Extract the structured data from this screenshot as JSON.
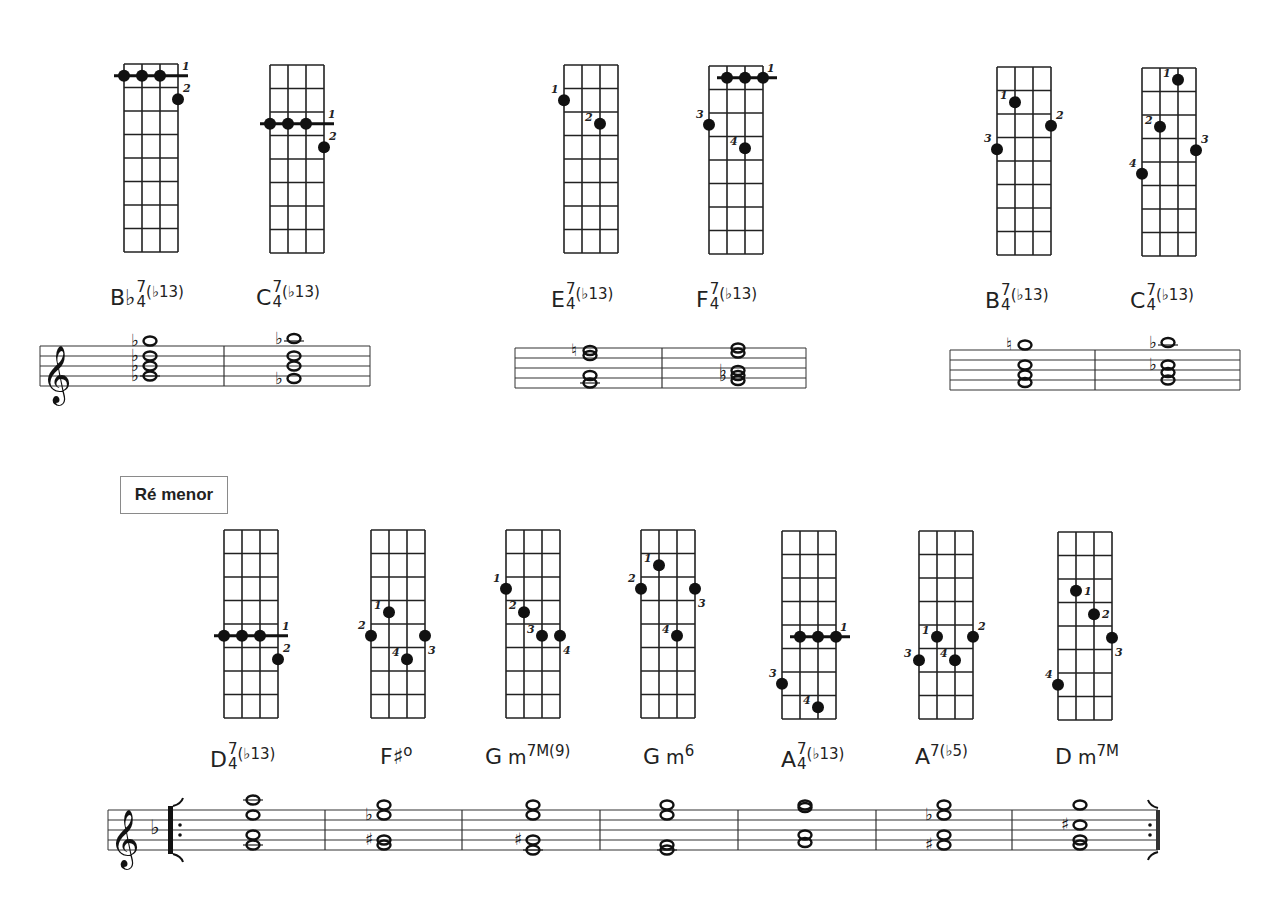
{
  "section": {
    "title": "Ré menor"
  },
  "chord_groups": [
    {
      "name": "group-1",
      "chords": [
        {
          "id": "bb4-7-b13",
          "root": "B♭",
          "sub": "4",
          "sup": "7",
          "ext": "(♭13)",
          "diagram": {
            "left": 124,
            "top": 64,
            "barre": {
              "fret": 0.5,
              "from": 0,
              "to": 2,
              "finger": "1"
            },
            "dots": [
              {
                "string": 3,
                "fret": 1.5,
                "finger": "2",
                "fpos": "ur"
              }
            ]
          }
        },
        {
          "id": "c4-7-b13",
          "root": "C",
          "sub": "4",
          "sup": "7",
          "ext": "(♭13)",
          "diagram": {
            "left": 270,
            "top": 65,
            "barre": {
              "fret": 2.5,
              "from": 0,
              "to": 2,
              "finger": "1"
            },
            "dots": [
              {
                "string": 3,
                "fret": 3.5,
                "finger": "2",
                "fpos": "ur"
              }
            ]
          }
        }
      ]
    },
    {
      "name": "group-2",
      "chords": [
        {
          "id": "e4-7-b13",
          "root": "E",
          "sub": "4",
          "sup": "7",
          "ext": "(♭13)",
          "diagram": {
            "left": 564,
            "top": 65,
            "barre": null,
            "dots": [
              {
                "string": 0,
                "fret": 1.5,
                "finger": "1",
                "fpos": "ul"
              },
              {
                "string": 2,
                "fret": 2.5,
                "finger": "2",
                "fpos": "l"
              }
            ]
          }
        },
        {
          "id": "f4-7-b13",
          "root": "F",
          "sub": "4",
          "sup": "7",
          "ext": "(♭13)",
          "diagram": {
            "left": 709,
            "top": 66,
            "barre": {
              "fret": 0.5,
              "from": 1,
              "to": 3,
              "finger": "1"
            },
            "dots": [
              {
                "string": 0,
                "fret": 2.5,
                "finger": "3",
                "fpos": "ul"
              },
              {
                "string": 2,
                "fret": 3.5,
                "finger": "4",
                "fpos": "l"
              }
            ]
          }
        }
      ]
    },
    {
      "name": "group-3",
      "chords": [
        {
          "id": "b4-7-b13",
          "root": "B",
          "sub": "4",
          "sup": "7",
          "ext": "(♭13)",
          "diagram": {
            "left": 997,
            "top": 67,
            "barre": null,
            "dots": [
              {
                "string": 1,
                "fret": 1.5,
                "finger": "1",
                "fpos": "l"
              },
              {
                "string": 3,
                "fret": 2.5,
                "finger": "2",
                "fpos": "ur"
              },
              {
                "string": 0,
                "fret": 3.5,
                "finger": "3",
                "fpos": "ul"
              }
            ]
          }
        },
        {
          "id": "c4-7-b13-alt",
          "root": "C",
          "sub": "4",
          "sup": "7",
          "ext": "(♭13)",
          "diagram": {
            "left": 1142,
            "top": 68,
            "barre": null,
            "dots": [
              {
                "string": 2,
                "fret": 0.5,
                "finger": "1",
                "fpos": "l"
              },
              {
                "string": 1,
                "fret": 2.5,
                "finger": "2",
                "fpos": "l"
              },
              {
                "string": 3,
                "fret": 3.5,
                "finger": "3",
                "fpos": "ur"
              },
              {
                "string": 0,
                "fret": 4.5,
                "finger": "4",
                "fpos": "ul"
              }
            ]
          }
        }
      ]
    },
    {
      "name": "re-menor",
      "chords": [
        {
          "id": "d4-7-b13",
          "root": "D",
          "sub": "4",
          "sup": "7",
          "ext": "(♭13)",
          "diagram": {
            "left": 224,
            "top": 530,
            "barre": {
              "fret": 4.5,
              "from": 0,
              "to": 2,
              "finger": "1"
            },
            "dots": [
              {
                "string": 3,
                "fret": 5.5,
                "finger": "2",
                "fpos": "ur"
              }
            ]
          }
        },
        {
          "id": "fsharp-dim",
          "root": "F♯",
          "sup": "o",
          "diagram": {
            "left": 371,
            "top": 530,
            "barre": null,
            "dots": [
              {
                "string": 1,
                "fret": 3.5,
                "finger": "1",
                "fpos": "l"
              },
              {
                "string": 0,
                "fret": 4.5,
                "finger": "2",
                "fpos": "ul"
              },
              {
                "string": 3,
                "fret": 4.5,
                "finger": "3",
                "fpos": "dr"
              },
              {
                "string": 2,
                "fret": 5.5,
                "finger": "4",
                "fpos": "l"
              }
            ]
          }
        },
        {
          "id": "gm7M9",
          "root": "G",
          "quality": "m",
          "sup": "7M(9)",
          "diagram": {
            "left": 506,
            "top": 530,
            "barre": null,
            "dots": [
              {
                "string": 0,
                "fret": 2.5,
                "finger": "1",
                "fpos": "ul"
              },
              {
                "string": 1,
                "fret": 3.5,
                "finger": "2",
                "fpos": "l"
              },
              {
                "string": 2,
                "fret": 4.5,
                "finger": "3",
                "fpos": "l"
              },
              {
                "string": 3,
                "fret": 4.5,
                "finger": "4",
                "fpos": "dr"
              }
            ]
          }
        },
        {
          "id": "gm6",
          "root": "G",
          "quality": "m",
          "sup": "6",
          "diagram": {
            "left": 641,
            "top": 530,
            "barre": null,
            "dots": [
              {
                "string": 1,
                "fret": 1.5,
                "finger": "1",
                "fpos": "l"
              },
              {
                "string": 0,
                "fret": 2.5,
                "finger": "2",
                "fpos": "ul"
              },
              {
                "string": 3,
                "fret": 2.5,
                "finger": "3",
                "fpos": "dr"
              },
              {
                "string": 2,
                "fret": 4.5,
                "finger": "4",
                "fpos": "l"
              }
            ]
          }
        },
        {
          "id": "a4-7-b13",
          "root": "A",
          "sub": "4",
          "sup": "7",
          "ext": "(♭13)",
          "diagram": {
            "left": 782,
            "top": 531,
            "barre": {
              "fret": 4.5,
              "from": 1,
              "to": 3,
              "finger": "1"
            },
            "dots": [
              {
                "string": 0,
                "fret": 6.5,
                "finger": "3",
                "fpos": "ul"
              },
              {
                "string": 2,
                "fret": 7.5,
                "finger": "4",
                "fpos": "l"
              }
            ]
          }
        },
        {
          "id": "a7-b5",
          "root": "A",
          "sup": "7(♭5)",
          "diagram": {
            "left": 919,
            "top": 531,
            "barre": null,
            "dots": [
              {
                "string": 1,
                "fret": 4.5,
                "finger": "1",
                "fpos": "l"
              },
              {
                "string": 3,
                "fret": 4.5,
                "finger": "2",
                "fpos": "ur"
              },
              {
                "string": 0,
                "fret": 5.5,
                "finger": "3",
                "fpos": "l"
              },
              {
                "string": 2,
                "fret": 5.5,
                "finger": "4",
                "fpos": "l"
              }
            ]
          }
        },
        {
          "id": "dm7M",
          "root": "D",
          "quality": "m",
          "sup": "7M",
          "diagram": {
            "left": 1058,
            "top": 532,
            "barre": null,
            "dots": [
              {
                "string": 1,
                "fret": 2.5,
                "finger": "1",
                "fpos": "r"
              },
              {
                "string": 2,
                "fret": 3.5,
                "finger": "2",
                "fpos": "r"
              },
              {
                "string": 3,
                "fret": 4.5,
                "finger": "3",
                "fpos": "dr"
              },
              {
                "string": 0,
                "fret": 6.5,
                "finger": "4",
                "fpos": "ul"
              }
            ]
          }
        }
      ]
    }
  ],
  "labels": [
    {
      "chord": "bb4-7-b13",
      "x": 110,
      "y": 284
    },
    {
      "chord": "c4-7-b13",
      "x": 256,
      "y": 284
    },
    {
      "chord": "e4-7-b13",
      "x": 551,
      "y": 286
    },
    {
      "chord": "f4-7-b13",
      "x": 696,
      "y": 286
    },
    {
      "chord": "b4-7-b13",
      "x": 985,
      "y": 287
    },
    {
      "chord": "c4-7-b13-alt",
      "x": 1130,
      "y": 287
    },
    {
      "chord": "d4-7-b13",
      "x": 210,
      "y": 746
    },
    {
      "chord": "fsharp-dim",
      "x": 380,
      "y": 746
    },
    {
      "chord": "gm7M9",
      "x": 485,
      "y": 746
    },
    {
      "chord": "gm6",
      "x": 643,
      "y": 746
    },
    {
      "chord": "a4-7-b13",
      "x": 781,
      "y": 746
    },
    {
      "chord": "a7-b5",
      "x": 915,
      "y": 746
    },
    {
      "chord": "dm7M",
      "x": 1055,
      "y": 746
    }
  ],
  "staves": [
    {
      "name": "staff-1",
      "x1": 40,
      "x2": 370,
      "top": 346,
      "clef": true,
      "key_flats": 0,
      "repeat": false,
      "barlines": [
        224
      ],
      "measures": [
        {
          "x": 150,
          "notes": [
            {
              "pos": -1,
              "acc": "♭"
            },
            {
              "pos": 2,
              "acc": "♭"
            },
            {
              "pos": 4,
              "acc": "♭"
            },
            {
              "pos": 6,
              "acc": "♭",
              "ledger": true
            }
          ]
        },
        {
          "x": 294,
          "notes": [
            {
              "pos": -1.5,
              "acc": "♭"
            },
            {
              "pos": 2
            },
            {
              "pos": 4
            },
            {
              "pos": 6.5,
              "acc": "♭"
            }
          ]
        }
      ]
    },
    {
      "name": "staff-2",
      "x1": 515,
      "x2": 806,
      "top": 348,
      "clef": false,
      "repeat": false,
      "barlines": [
        662
      ],
      "measures": [
        {
          "x": 590,
          "notes": [
            {
              "pos": 0.5,
              "acc": "♮"
            },
            {
              "pos": 1.5
            },
            {
              "pos": 5.5
            },
            {
              "pos": 7,
              "ledger": true
            }
          ]
        },
        {
          "x": 738,
          "notes": [
            {
              "pos": 0
            },
            {
              "pos": 1
            },
            {
              "pos": 4.5,
              "acc": "♭"
            },
            {
              "pos": 5.5,
              "acc": "♭"
            },
            {
              "pos": 6.5
            }
          ]
        }
      ]
    },
    {
      "name": "staff-3",
      "x1": 950,
      "x2": 1240,
      "top": 350,
      "clef": false,
      "repeat": false,
      "barlines": [
        1095
      ],
      "measures": [
        {
          "x": 1025,
          "notes": [
            {
              "pos": -1,
              "acc": "♮"
            },
            {
              "pos": 3
            },
            {
              "pos": 5
            },
            {
              "pos": 6.5
            }
          ]
        },
        {
          "x": 1168,
          "notes": [
            {
              "pos": -1.5,
              "acc": "♭"
            },
            {
              "pos": 3,
              "acc": "♭"
            },
            {
              "pos": 4.5
            },
            {
              "pos": 6
            }
          ]
        }
      ]
    },
    {
      "name": "staff-re-menor",
      "x1": 108,
      "x2": 1158,
      "top": 810,
      "clef": true,
      "key_flats": 1,
      "repeat": true,
      "barlines": [
        325,
        462,
        600,
        738,
        876,
        1012
      ],
      "measures": [
        {
          "x": 253,
          "notes": [
            {
              "pos": -2,
              "ledger": true
            },
            {
              "pos": 1
            },
            {
              "pos": 5
            },
            {
              "pos": 7,
              "ledger": true
            }
          ]
        },
        {
          "x": 384,
          "notes": [
            {
              "pos": -1
            },
            {
              "pos": 1,
              "acc": "♭"
            },
            {
              "pos": 6,
              "acc": "♯"
            },
            {
              "pos": 7
            }
          ]
        },
        {
          "x": 533,
          "notes": [
            {
              "pos": -1
            },
            {
              "pos": 1
            },
            {
              "pos": 6,
              "acc": "♯"
            },
            {
              "pos": 8,
              "ledger": true
            }
          ]
        },
        {
          "x": 667,
          "notes": [
            {
              "pos": -1
            },
            {
              "pos": 1
            },
            {
              "pos": 7
            },
            {
              "pos": 8,
              "ledger": true
            }
          ]
        },
        {
          "x": 805,
          "notes": [
            {
              "pos": -1
            },
            {
              "pos": -0.5
            },
            {
              "pos": 5
            },
            {
              "pos": 6.5
            }
          ]
        },
        {
          "x": 944,
          "notes": [
            {
              "pos": -1
            },
            {
              "pos": 1,
              "acc": "♭"
            },
            {
              "pos": 5
            },
            {
              "pos": 7,
              "acc": "♯"
            }
          ]
        },
        {
          "x": 1080,
          "notes": [
            {
              "pos": -1
            },
            {
              "pos": 3,
              "acc": "♯"
            },
            {
              "pos": 6
            },
            {
              "pos": 7
            }
          ]
        }
      ]
    }
  ]
}
